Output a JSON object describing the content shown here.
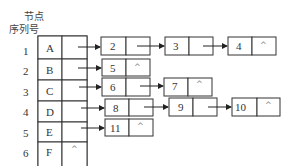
{
  "header": {
    "line1": "节点",
    "line2": "序列号"
  },
  "null_symbol": "^",
  "head_nodes": [
    {
      "index": "1",
      "label": "A",
      "null": false
    },
    {
      "index": "2",
      "label": "B",
      "null": false
    },
    {
      "index": "3",
      "label": "C",
      "null": false
    },
    {
      "index": "4",
      "label": "D",
      "null": false
    },
    {
      "index": "5",
      "label": "E",
      "null": false
    },
    {
      "index": "6",
      "label": "F",
      "null": true
    }
  ],
  "adjacency_lists": [
    {
      "row": "1",
      "nodes": [
        "2",
        "3",
        "4"
      ]
    },
    {
      "row": "2",
      "nodes": [
        "5"
      ]
    },
    {
      "row": "3",
      "nodes": [
        "6",
        "7"
      ]
    },
    {
      "row": "4",
      "nodes": [
        "8",
        "9",
        "10"
      ]
    },
    {
      "row": "5",
      "nodes": [
        "11"
      ]
    },
    {
      "row": "6",
      "nodes": []
    }
  ]
}
